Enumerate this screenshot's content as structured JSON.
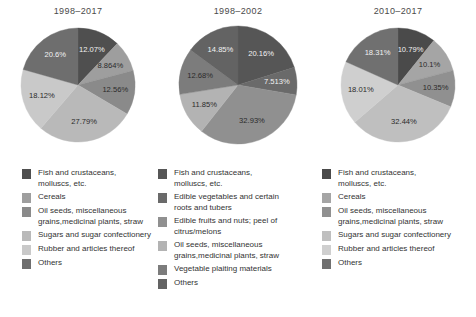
{
  "chart_data": [
    {
      "type": "pie",
      "title": "1998–2017",
      "categories": [
        "Fish and crustaceans, molluscs, etc.",
        "Cereals",
        "Oil seeds, miscellaneous grains,medicinal plants, straw",
        "Sugars and sugar confectionery",
        "Rubber and articles thereof",
        "Others"
      ],
      "values": [
        12.07,
        8.864,
        12.56,
        27.79,
        18.12,
        20.6
      ],
      "labels": [
        "12.07%",
        "8.864%",
        "12.56%",
        "27.79%",
        "18.12%",
        "20.6%"
      ],
      "colors": [
        "#4f4f4f",
        "#9e9e9e",
        "#8a8a8a",
        "#b9b9b9",
        "#c9c9c9",
        "#6e6e6e"
      ],
      "legend_position": "below",
      "grid": false
    },
    {
      "type": "pie",
      "title": "1998–2002",
      "categories": [
        "Fish and crustaceans, molluscs, etc.",
        "Edible vegetables and certain roots and tubers",
        "Edible fruits and nuts; peel of citrus/melons",
        "Oil seeds, miscellaneous grains,medicinal plants, straw",
        "Vegetable plaiting materials",
        "Others"
      ],
      "values": [
        20.16,
        7.513,
        32.93,
        11.85,
        12.68,
        14.85
      ],
      "labels": [
        "20.16%",
        "7.513%",
        "32.93%",
        "11.85%",
        "12.68%",
        "14.85%"
      ],
      "colors": [
        "#565656",
        "#6a6a6a",
        "#909090",
        "#b3b3b3",
        "#7c7c7c",
        "#636363"
      ],
      "legend_position": "below",
      "grid": false
    },
    {
      "type": "pie",
      "title": "2010–2017",
      "categories": [
        "Fish and crustaceans, molluscs, etc.",
        "Cereals",
        "Oil seeds, miscellaneous grains,medicinal plants, straw",
        "Sugars and sugar confectionery",
        "Rubber and articles thereof",
        "Others"
      ],
      "values": [
        10.79,
        10.1,
        10.35,
        32.44,
        18.01,
        18.31
      ],
      "labels": [
        "10.79%",
        "10.1%",
        "10.35%",
        "32.44%",
        "18.01%",
        "18.31%"
      ],
      "colors": [
        "#4a4a4a",
        "#a5a5a5",
        "#909090",
        "#bfbfbf",
        "#cfcfcf",
        "#707070"
      ],
      "legend_position": "below",
      "grid": false
    }
  ],
  "panels": [
    {
      "title": "1998–2017",
      "slices": [
        {
          "label": "12.07%",
          "value": 12.07,
          "color": "#4f4f4f",
          "label_color": "light"
        },
        {
          "label": "8.864%",
          "value": 8.864,
          "color": "#9e9e9e",
          "label_color": "dark"
        },
        {
          "label": "12.56%",
          "value": 12.56,
          "color": "#8a8a8a",
          "label_color": "dark"
        },
        {
          "label": "27.79%",
          "value": 27.79,
          "color": "#b9b9b9",
          "label_color": "dark"
        },
        {
          "label": "18.12%",
          "value": 18.12,
          "color": "#c9c9c9",
          "label_color": "dark"
        },
        {
          "label": "20.6%",
          "value": 20.6,
          "color": "#6e6e6e",
          "label_color": "light"
        }
      ],
      "legend": [
        {
          "color": "#4f4f4f",
          "text": "Fish and crustaceans,\nmolluscs, etc."
        },
        {
          "color": "#9e9e9e",
          "text": "Cereals"
        },
        {
          "color": "#8a8a8a",
          "text": "Oil seeds, miscellaneous\ngrains,medicinal plants, straw"
        },
        {
          "color": "#b9b9b9",
          "text": "Sugars and sugar confectionery"
        },
        {
          "color": "#c9c9c9",
          "text": "Rubber and articles thereof"
        },
        {
          "color": "#6e6e6e",
          "text": "Others"
        }
      ]
    },
    {
      "title": "1998–2002",
      "slices": [
        {
          "label": "20.16%",
          "value": 20.16,
          "color": "#565656",
          "label_color": "light"
        },
        {
          "label": "7.513%",
          "value": 7.513,
          "color": "#6a6a6a",
          "label_color": "light"
        },
        {
          "label": "32.93%",
          "value": 32.93,
          "color": "#909090",
          "label_color": "dark"
        },
        {
          "label": "11.85%",
          "value": 11.85,
          "color": "#b3b3b3",
          "label_color": "dark"
        },
        {
          "label": "12.68%",
          "value": 12.68,
          "color": "#7c7c7c",
          "label_color": "dark"
        },
        {
          "label": "14.85%",
          "value": 14.85,
          "color": "#636363",
          "label_color": "light"
        }
      ],
      "legend": [
        {
          "color": "#565656",
          "text": "Fish and crustaceans,\nmolluscs, etc."
        },
        {
          "color": "#6a6a6a",
          "text": "Edible vegetables and certain\nroots and tubers"
        },
        {
          "color": "#909090",
          "text": "Edible fruits and nuts; peel of\ncitrus/melons"
        },
        {
          "color": "#b3b3b3",
          "text": "Oil seeds, miscellaneous\ngrains,medicinal plants, straw"
        },
        {
          "color": "#7c7c7c",
          "text": "Vegetable plaiting materials"
        },
        {
          "color": "#636363",
          "text": "Others"
        }
      ]
    },
    {
      "title": "2010–2017",
      "slices": [
        {
          "label": "10.79%",
          "value": 10.79,
          "color": "#4a4a4a",
          "label_color": "light"
        },
        {
          "label": "10.1%",
          "value": 10.1,
          "color": "#a5a5a5",
          "label_color": "dark"
        },
        {
          "label": "10.35%",
          "value": 10.35,
          "color": "#909090",
          "label_color": "dark"
        },
        {
          "label": "32.44%",
          "value": 32.44,
          "color": "#bfbfbf",
          "label_color": "dark"
        },
        {
          "label": "18.01%",
          "value": 18.01,
          "color": "#cfcfcf",
          "label_color": "dark"
        },
        {
          "label": "18.31%",
          "value": 18.31,
          "color": "#707070",
          "label_color": "light"
        }
      ],
      "legend": [
        {
          "color": "#4a4a4a",
          "text": "Fish and crustaceans,\nmolluscs, etc."
        },
        {
          "color": "#a5a5a5",
          "text": "Cereals"
        },
        {
          "color": "#909090",
          "text": "Oil seeds, miscellaneous\ngrains,medicinal plants, straw"
        },
        {
          "color": "#bfbfbf",
          "text": "Sugars and sugar confectionery"
        },
        {
          "color": "#cfcfcf",
          "text": "Rubber and articles thereof"
        },
        {
          "color": "#707070",
          "text": "Others"
        }
      ]
    }
  ]
}
